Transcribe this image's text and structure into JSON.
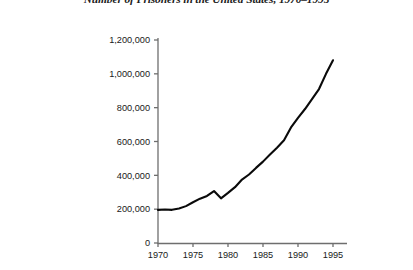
{
  "chart_data": {
    "type": "line",
    "title": "Number of Prisoners in the United States, 1970–1995",
    "xlabel": "",
    "ylabel": "",
    "x": [
      1970,
      1971,
      1972,
      1973,
      1974,
      1975,
      1976,
      1977,
      1978,
      1979,
      1980,
      1981,
      1982,
      1983,
      1984,
      1985,
      1986,
      1987,
      1988,
      1989,
      1990,
      1991,
      1992,
      1993,
      1994,
      1995
    ],
    "values": [
      196000,
      198000,
      196000,
      204000,
      218000,
      241000,
      262000,
      278000,
      307000,
      264000,
      296000,
      330000,
      375000,
      405000,
      444000,
      481000,
      523000,
      563000,
      607000,
      683000,
      740000,
      792000,
      850000,
      910000,
      1000000,
      1080000
    ],
    "series": [
      {
        "name": "Number of Prisoners",
        "values": [
          196000,
          198000,
          196000,
          204000,
          218000,
          241000,
          262000,
          278000,
          307000,
          264000,
          296000,
          330000,
          375000,
          405000,
          444000,
          481000,
          523000,
          563000,
          607000,
          683000,
          740000,
          792000,
          850000,
          910000,
          1000000,
          1080000
        ]
      }
    ],
    "xlim": [
      1970,
      1996
    ],
    "ylim": [
      0,
      1200000
    ],
    "xticks": [
      1970,
      1975,
      1980,
      1985,
      1990,
      1995
    ],
    "xticklabels": [
      "1970",
      "1975",
      "1980",
      "1985",
      "1990",
      "1995"
    ],
    "yticks": [
      0,
      200000,
      400000,
      600000,
      800000,
      1000000,
      1200000
    ],
    "yticklabels": [
      "0",
      "200,000",
      "400,000",
      "600,000",
      "800,000",
      "1,000,000",
      "1,200,000"
    ],
    "grid": false,
    "legend": "none",
    "line_color": "#000000",
    "axis_color": "#6e6e6e"
  }
}
